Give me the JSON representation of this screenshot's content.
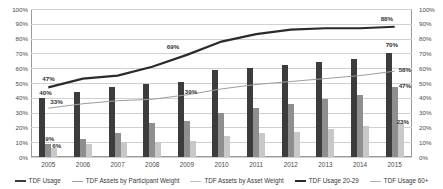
{
  "chart_data": {
    "type": "bar",
    "title": "",
    "xlabel": "",
    "ylabel": "",
    "ylim": [
      0,
      100
    ],
    "grid": true,
    "legend_position": "bottom",
    "categories": [
      "2005",
      "2006",
      "2007",
      "2008",
      "2009",
      "2010",
      "2011",
      "2012",
      "2013",
      "2014",
      "2015"
    ],
    "ytick_labels": [
      "100%",
      "90%",
      "80%",
      "70%",
      "60%",
      "50%",
      "40%",
      "30%",
      "20%",
      "10%",
      "0%"
    ],
    "ytick_values": [
      100,
      90,
      80,
      70,
      60,
      50,
      40,
      30,
      20,
      10,
      0
    ],
    "series": [
      {
        "name": "TDF Usage",
        "kind": "bar",
        "color": "#3c3c3c",
        "values": [
          40,
          44,
          47,
          49,
          51,
          59,
          60,
          62,
          64,
          66,
          70
        ]
      },
      {
        "name": "TDF Assets by Participant Weight",
        "kind": "bar",
        "color": "#8f8f8f",
        "values": [
          9,
          12,
          16,
          23,
          24,
          30,
          33,
          36,
          39,
          42,
          47
        ]
      },
      {
        "name": "TDF Assets by Asset Weight",
        "kind": "bar",
        "color": "#c8c8c8",
        "values": [
          6,
          9,
          10,
          10,
          11,
          14,
          16,
          17,
          19,
          21,
          23
        ]
      },
      {
        "name": "TDF Usage 20-29",
        "kind": "line",
        "color": "#2b2b2b",
        "values": [
          47,
          53,
          55,
          61,
          69,
          78,
          83,
          86,
          87,
          87,
          88
        ]
      },
      {
        "name": "TDF Usage 60+",
        "kind": "line",
        "color": "#9e9e9e",
        "values": [
          33,
          36,
          38,
          39,
          42,
          46,
          49,
          51,
          53,
          55,
          58
        ]
      }
    ],
    "data_labels": [
      {
        "text": "40%",
        "series": "TDF Usage",
        "category": "2005",
        "value": 40
      },
      {
        "text": "9%",
        "series": "TDF Assets by Participant Weight",
        "category": "2005",
        "value": 9
      },
      {
        "text": "6%",
        "series": "TDF Assets by Asset Weight",
        "category": "2005",
        "value": 6
      },
      {
        "text": "47%",
        "series": "TDF Usage 20-29",
        "category": "2005",
        "value": 47
      },
      {
        "text": "33%",
        "series": "TDF Usage 60+",
        "category": "2005",
        "value": 33
      },
      {
        "text": "39%",
        "series": "TDF Usage 60+",
        "category": "2009",
        "value": 39
      },
      {
        "text": "69%",
        "series": "TDF Usage 20-29",
        "category": "2009",
        "value": 69
      },
      {
        "text": "88%",
        "series": "TDF Usage 20-29",
        "category": "2015",
        "value": 88
      },
      {
        "text": "70%",
        "series": "TDF Usage",
        "category": "2015",
        "value": 70
      },
      {
        "text": "58%",
        "series": "TDF Usage 60+",
        "category": "2015",
        "value": 58
      },
      {
        "text": "47%",
        "series": "TDF Assets by Participant Weight",
        "category": "2015",
        "value": 47
      },
      {
        "text": "23%",
        "series": "TDF Assets by Asset Weight",
        "category": "2015",
        "value": 23
      }
    ],
    "legend": [
      {
        "label": "TDF Usage",
        "color": "#3c3c3c",
        "marker": "thick-line"
      },
      {
        "label": "TDF Assets by Participant Weight",
        "color": "#9e9e9e",
        "marker": "line"
      },
      {
        "label": "TDF Assets by Asset Weight",
        "color": "#c0c0c0",
        "marker": "line"
      },
      {
        "label": "TDF Usage 20-29",
        "color": "#2b2b2b",
        "marker": "thick-line"
      },
      {
        "label": "TDF Usage 60+",
        "color": "#b0b0b0",
        "marker": "line"
      }
    ]
  }
}
